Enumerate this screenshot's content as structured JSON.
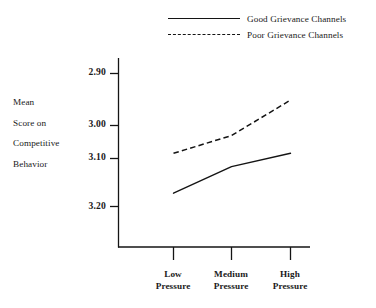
{
  "chart_data": {
    "type": "line",
    "title": "",
    "xlabel": "",
    "ylabel": "Mean Score on Competitive Behavior",
    "categories": [
      "Low Pressure",
      "Medium Pressure",
      "High Pressure"
    ],
    "yticks": [
      "2.90",
      "3.00",
      "3.10",
      "3.20"
    ],
    "ylim": [
      2.9,
      3.2
    ],
    "y_axis_inverted": true,
    "grid": false,
    "legend_position": "top-right",
    "series": [
      {
        "name": "Good Grievance Channels",
        "style": "solid",
        "color": "#141414",
        "values": [
          3.17,
          3.11,
          3.08
        ]
      },
      {
        "name": "Poor Grievance Channels",
        "style": "dashed",
        "color": "#141414",
        "values": [
          3.08,
          3.04,
          2.96
        ]
      }
    ]
  },
  "legend": {
    "items": [
      {
        "label": "Good Grievance Channels"
      },
      {
        "label": "Poor Grievance Channels"
      }
    ]
  },
  "y_axis": {
    "caption_lines": [
      "Mean",
      "Score on",
      "Competitive",
      "Behavior"
    ],
    "tick_labels": [
      "2.90",
      "3.00",
      "3.10",
      "3.20"
    ]
  },
  "x_axis": {
    "tick_labels": [
      {
        "line1": "Low",
        "line2": "Pressure"
      },
      {
        "line1": "Medium",
        "line2": "Pressure"
      },
      {
        "line1": "High",
        "line2": "Pressure"
      }
    ]
  }
}
